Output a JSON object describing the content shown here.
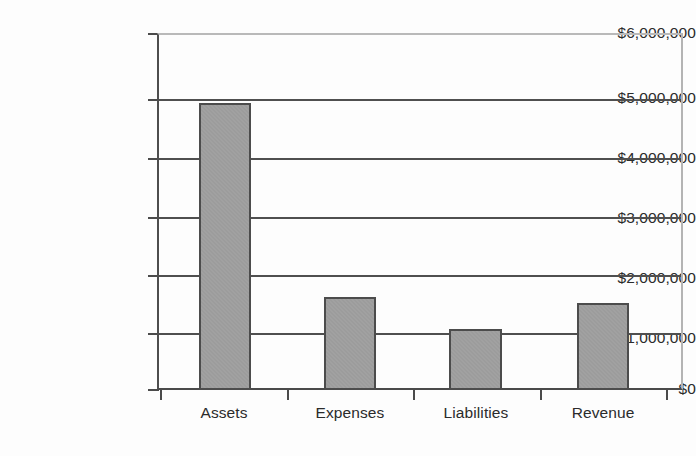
{
  "chart_data": {
    "type": "bar",
    "title": "",
    "subtitle": "",
    "xlabel": "",
    "ylabel": "",
    "categories": [
      "Assets",
      "Expenses",
      "Liabilities",
      "Revenue"
    ],
    "values": [
      4830000,
      1570000,
      1030000,
      1470000
    ],
    "ylim": [
      0,
      6000000
    ],
    "ytick_step": 1000000,
    "ytick_labels": [
      "$6,000,000",
      "$5,000,000",
      "$4,000,000",
      "$3,000,000",
      "$2,000,000",
      "$1,000,000",
      "$0"
    ],
    "ytick_values": [
      6000000,
      5000000,
      4000000,
      3000000,
      2000000,
      1000000,
      0
    ],
    "grid": "horizontal",
    "legend": "none",
    "annotations": [],
    "series": [
      {
        "name": "",
        "values": [
          4830000,
          1570000,
          1030000,
          1470000
        ]
      }
    ],
    "colors": {
      "bar_fill": "#9c9c9c",
      "bar_border": "#4c4c4c",
      "gridline": "#4f4f4f",
      "axis": "#4a4a4a",
      "text": "#2b2b2b",
      "background": "#fdfdfd"
    }
  }
}
